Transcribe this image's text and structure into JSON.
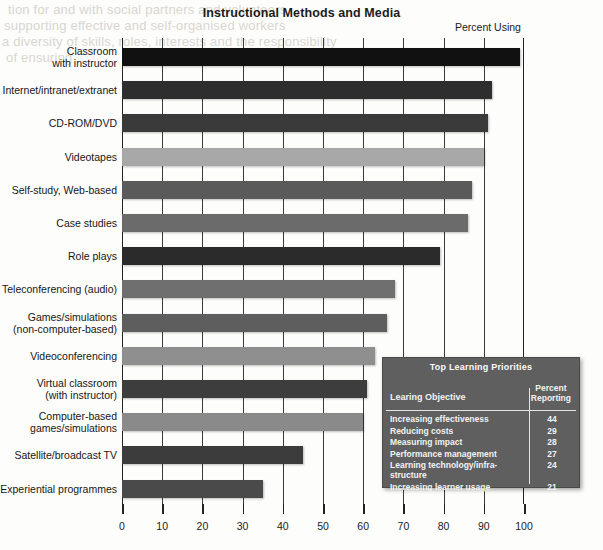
{
  "chart_data": {
    "type": "bar",
    "orientation": "horizontal",
    "title": "Instructional Methods and Media",
    "axis_title": "Percent Using",
    "xlabel": "",
    "ylabel": "",
    "xlim": [
      0,
      100
    ],
    "xticks": [
      0,
      10,
      20,
      30,
      40,
      50,
      60,
      70,
      80,
      90,
      100
    ],
    "grid": true,
    "legend": "none",
    "categories": [
      "Classroom\nwith instructor",
      "Internet/intranet/extranet",
      "CD-ROM/DVD",
      "Videotapes",
      "Self-study, Web-based",
      "Case studies",
      "Role plays",
      "Teleconferencing (audio)",
      "Games/simulations\n(non-computer-based)",
      "Videoconferencing",
      "Virtual classroom\n(with instructor)",
      "Computer-based\ngames/simulations",
      "Satellite/broadcast TV",
      "Experiential programmes"
    ],
    "values": [
      99,
      92,
      91,
      90,
      87,
      86,
      79,
      68,
      66,
      63,
      61,
      60,
      45,
      35
    ],
    "bar_colors": [
      "#111111",
      "#2e2e2e",
      "#3a3a3a",
      "#a8a8a8",
      "#5a5a5a",
      "#6b6b6b",
      "#2b2b2b",
      "#6f6f6f",
      "#5e5e5e",
      "#8f8f8f",
      "#3d3d3d",
      "#8a8a8a",
      "#3c3c3c",
      "#4a4a4a"
    ]
  },
  "inset_table": {
    "title": "Top Learning Priorities",
    "columns": [
      "Learing Objective",
      "Percent\nReporting"
    ],
    "rows": [
      {
        "label": "Increasing effectiveness",
        "value": "44"
      },
      {
        "label": "Reducing costs",
        "value": "29"
      },
      {
        "label": "Measuring impact",
        "value": "28"
      },
      {
        "label": "Performance management",
        "value": "27"
      },
      {
        "label": "Learning technology/infra-\nstructure",
        "value": "24"
      },
      {
        "label": "Increasing learner usage",
        "value": "21"
      }
    ]
  },
  "background_bleed": [
    "tion for and with social partners and volunteers",
    "supporting effective and self-organised workers",
    "a diversity of skills, roles, interests and the responsibility",
    "of ensuring"
  ]
}
